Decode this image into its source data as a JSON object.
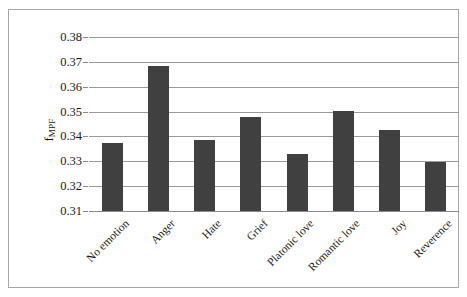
{
  "chart_data": {
    "type": "bar",
    "title": "",
    "subtitle": "",
    "xlabel": "",
    "ylabel": "f_MPF",
    "ylabel_base": "f",
    "ylabel_sub": "MPF",
    "categories": [
      "No emotion",
      "Anger",
      "Hate",
      "Grief",
      "Platonic love",
      "Romantic love",
      "Joy",
      "Reverence"
    ],
    "values": [
      0.3375,
      0.3685,
      0.3385,
      0.348,
      0.333,
      0.3502,
      0.3425,
      0.3297
    ],
    "ylim": [
      0.31,
      0.38
    ],
    "yticks": [
      0.31,
      0.32,
      0.33,
      0.34,
      0.35,
      0.36,
      0.37,
      0.38
    ],
    "ytick_labels": [
      "0.31",
      "0.32",
      "0.33",
      "0.34",
      "0.35",
      "0.36",
      "0.37",
      "0.38"
    ],
    "grid": true,
    "grid_axis": "y",
    "legend": false,
    "legend_position": "none",
    "bar_color": "#404040",
    "gridline_color": "#9a9a9a",
    "frame_color": "#a6a6a6",
    "background_color": "#ffffff",
    "text_color": "#1a1a1a",
    "x_label_rotation": -45
  }
}
